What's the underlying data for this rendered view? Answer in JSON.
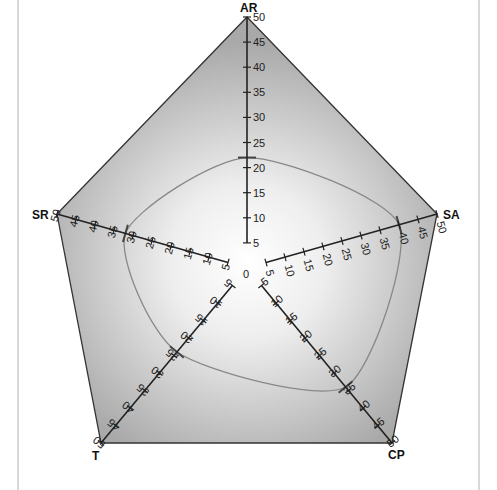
{
  "chart_data": {
    "type": "radar",
    "title": "",
    "axes": [
      "AR",
      "SA",
      "CP",
      "T",
      "SR"
    ],
    "range": [
      0,
      50
    ],
    "ticks": [
      5,
      10,
      15,
      20,
      25,
      30,
      35,
      40,
      45,
      50
    ],
    "center_label": "0",
    "series": [
      {
        "name": "profile",
        "values": {
          "AR": 22,
          "SA": 40,
          "CP": 34,
          "T": 24,
          "SR": 32
        }
      }
    ],
    "grid": false,
    "legend": "none"
  },
  "colors": {
    "fill_outer": "#a8a8a8",
    "fill_inner": "#ffffff",
    "outline": "#333333",
    "axis": "#222222",
    "data_line": "#808080",
    "marker": "#444444"
  }
}
